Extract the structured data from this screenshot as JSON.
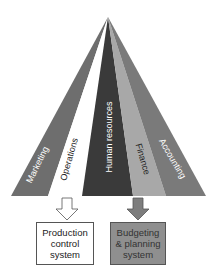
{
  "diagram": {
    "segments": [
      {
        "label": "Marketing",
        "color": "#6e6e6e",
        "text_color": "#ffffff"
      },
      {
        "label": "Operations",
        "color": "#ffffff",
        "text_color": "#222222"
      },
      {
        "label": "Human resources",
        "color": "#3a3a3a",
        "text_color": "#ffffff"
      },
      {
        "label": "Finance",
        "color": "#a8a8a8",
        "text_color": "#222222"
      },
      {
        "label": "Accounting",
        "color": "#7a7a7a",
        "text_color": "#ffffff"
      }
    ],
    "outputs": [
      {
        "label": "Production\ncontrol\nsystem",
        "fill": "#ffffff",
        "source": "Operations"
      },
      {
        "label": "Budgeting\n& planning\nsystem",
        "fill": "#8f8f8f",
        "source": "Finance"
      }
    ]
  }
}
